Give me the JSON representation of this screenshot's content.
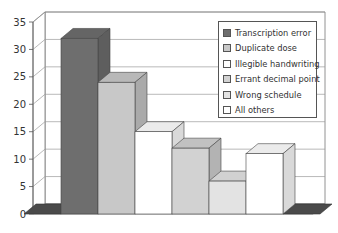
{
  "chart_data": {
    "type": "bar",
    "style": "3d-column",
    "title": "",
    "xlabel": "",
    "ylabel": "",
    "ylim": [
      0,
      35
    ],
    "yticks": [
      0,
      5,
      10,
      15,
      20,
      25,
      30,
      35
    ],
    "grid": true,
    "legend_position": "upper-right-inside",
    "categories": [
      "Transcription error",
      "Duplicate dose",
      "Illegible handwriting",
      "Errant decimal point",
      "Wrong schedule",
      "All others"
    ],
    "values": [
      32,
      24,
      15,
      12,
      6,
      11
    ],
    "colors": [
      "#6e6e6e",
      "#c8c8c8",
      "#ffffff",
      "#d2d2d2",
      "#e3e3e3",
      "#ffffff"
    ]
  },
  "legend": {
    "items": [
      {
        "label": "Transcription error",
        "color": "#6e6e6e"
      },
      {
        "label": "Duplicate dose",
        "color": "#c8c8c8"
      },
      {
        "label": "Illegible handwriting",
        "color": "#ffffff"
      },
      {
        "label": "Errant decimal point",
        "color": "#d2d2d2"
      },
      {
        "label": "Wrong schedule",
        "color": "#e3e3e3"
      },
      {
        "label": "All others",
        "color": "#ffffff"
      }
    ]
  },
  "axis": {
    "ticks": [
      "0",
      "5",
      "10",
      "15",
      "20",
      "25",
      "30",
      "35"
    ]
  }
}
